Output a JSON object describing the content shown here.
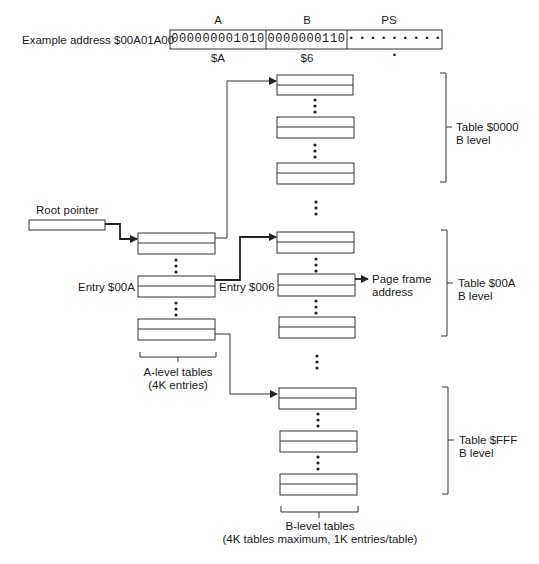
{
  "address": {
    "label": "Example address $00A01A00",
    "fields": [
      {
        "name": "A",
        "bits": "000000001010",
        "hex": "$A"
      },
      {
        "name": "B",
        "bits": "0000000110",
        "hex": "$6"
      },
      {
        "name": "PS",
        "bits": "• • • • • • • • • •",
        "hex": ""
      }
    ]
  },
  "root_pointer": {
    "label": "Root pointer"
  },
  "a_level": {
    "entry_label": "Entry $00A",
    "caption_line1": "A-level tables",
    "caption_line2": "(4K entries)"
  },
  "b_level": {
    "entry_label": "Entry $006",
    "page_frame_line1": "Page frame",
    "page_frame_line2": "address",
    "tables": [
      {
        "label_line1": "Table $0000",
        "label_line2": "B level"
      },
      {
        "label_line1": "Table $00A",
        "label_line2": "B level"
      },
      {
        "label_line1": "Table $FFF",
        "label_line2": "B level"
      }
    ],
    "caption_line1": "B-level tables",
    "caption_line2": "(4K tables maximum, 1K entries/table)"
  },
  "colors": {
    "line": "#333333",
    "text": "#1a1a1a",
    "background": "#ffffff"
  }
}
